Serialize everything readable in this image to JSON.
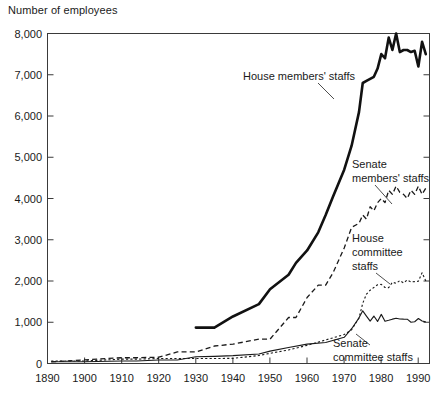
{
  "chart_data": {
    "type": "line",
    "title": "Number of employees",
    "xlabel": "",
    "ylabel": "Number of employees",
    "xlim": [
      1890,
      1993
    ],
    "ylim": [
      0,
      8000
    ],
    "grid": false,
    "legend": "inline-annotations",
    "y_ticks": [
      "0",
      "1,000",
      "2,000",
      "3,000",
      "4,000",
      "5,000",
      "6,000",
      "7,000",
      "8,000"
    ],
    "y_tick_values": [
      0,
      1000,
      2000,
      3000,
      4000,
      5000,
      6000,
      7000,
      8000
    ],
    "x_ticks": [
      "1890",
      "1900",
      "1910",
      "1920",
      "1930",
      "1940",
      "1950",
      "1960",
      "1970",
      "1980",
      "1990"
    ],
    "x_tick_values": [
      1890,
      1900,
      1910,
      1920,
      1930,
      1940,
      1950,
      1960,
      1970,
      1980,
      1990
    ],
    "series": [
      {
        "name": "House members' staffs",
        "style": "thick-solid",
        "x": [
          1930,
          1935,
          1940,
          1947,
          1950,
          1955,
          1957,
          1960,
          1963,
          1965,
          1967,
          1970,
          1972,
          1974,
          1975,
          1976,
          1977,
          1978,
          1979,
          1980,
          1981,
          1982,
          1983,
          1984,
          1985,
          1986,
          1987,
          1988,
          1989,
          1990,
          1991,
          1992
        ],
        "values": [
          870,
          870,
          1140,
          1440,
          1800,
          2150,
          2440,
          2740,
          3180,
          3600,
          4050,
          4700,
          5280,
          6100,
          6800,
          6850,
          6900,
          6950,
          7150,
          7500,
          7400,
          7900,
          7600,
          8000,
          7550,
          7600,
          7600,
          7550,
          7580,
          7200,
          7800,
          7500
        ]
      },
      {
        "name": "Senate members' staffs",
        "style": "dashed-long",
        "x": [
          1891,
          1900,
          1910,
          1914,
          1920,
          1925,
          1930,
          1935,
          1940,
          1947,
          1950,
          1955,
          1957,
          1960,
          1963,
          1965,
          1967,
          1970,
          1972,
          1974,
          1975,
          1976,
          1977,
          1978,
          1979,
          1980,
          1981,
          1982,
          1983,
          1984,
          1985,
          1986,
          1987,
          1988,
          1989,
          1990,
          1991,
          1992
        ],
        "values": [
          39,
          90,
          140,
          140,
          152,
          280,
          280,
          424,
          470,
          590,
          590,
          1115,
          1115,
          1600,
          1900,
          1900,
          2200,
          2800,
          3300,
          3400,
          3600,
          3500,
          3800,
          3700,
          3900,
          4000,
          3900,
          4200,
          4100,
          4300,
          4150,
          4100,
          4000,
          4200,
          4100,
          4300,
          4100,
          4250
        ]
      },
      {
        "name": "House committee staffs",
        "style": "dashed-short",
        "x": [
          1891,
          1900,
          1910,
          1914,
          1920,
          1925,
          1930,
          1935,
          1940,
          1947,
          1950,
          1955,
          1960,
          1965,
          1970,
          1972,
          1974,
          1975,
          1976,
          1977,
          1978,
          1979,
          1980,
          1981,
          1982,
          1983,
          1984,
          1985,
          1986,
          1987,
          1988,
          1989,
          1990,
          1991,
          1992
        ],
        "values": [
          62,
          62,
          105,
          105,
          120,
          120,
          120,
          122,
          124,
          193,
          246,
          329,
          440,
          571,
          702,
          817,
          1107,
          1460,
          1680,
          1776,
          1844,
          1909,
          1917,
          1843,
          1839,
          1970,
          1944,
          2009,
          1954,
          2024,
          1976,
          1986,
          1993,
          2201,
          2000
        ]
      },
      {
        "name": "Senate committee staffs",
        "style": "thin-solid",
        "x": [
          1891,
          1900,
          1910,
          1914,
          1920,
          1925,
          1930,
          1935,
          1940,
          1947,
          1950,
          1955,
          1960,
          1965,
          1970,
          1972,
          1974,
          1975,
          1976,
          1977,
          1978,
          1979,
          1980,
          1981,
          1982,
          1983,
          1984,
          1985,
          1986,
          1987,
          1988,
          1989,
          1990,
          1991,
          1992
        ],
        "values": [
          41,
          41,
          61,
          61,
          85,
          85,
          163,
          172,
          190,
          232,
          300,
          386,
          470,
          509,
          635,
          844,
          1107,
          1277,
          1150,
          1028,
          1150,
          1020,
          1191,
          1022,
          1047,
          1075,
          1095,
          1080,
          1075,
          1074,
          1000,
          1013,
          1090,
          1030,
          1010
        ]
      }
    ],
    "annotations": [
      {
        "name": "house-members-label",
        "text": "House members' staffs"
      },
      {
        "name": "senate-members-label-line1",
        "text": "Senate"
      },
      {
        "name": "senate-members-label-line2",
        "text": "members' staffs"
      },
      {
        "name": "house-committee-label-line1",
        "text": "House"
      },
      {
        "name": "house-committee-label-line2",
        "text": "committee"
      },
      {
        "name": "house-committee-label-line3",
        "text": "staffs"
      },
      {
        "name": "senate-committee-label-line1",
        "text": "Senate"
      },
      {
        "name": "senate-committee-label-line2",
        "text": "committee staffs"
      }
    ],
    "colors": {
      "line": "#1a1a1a",
      "frame": "#3a3a3a",
      "background": "#ffffff"
    }
  }
}
